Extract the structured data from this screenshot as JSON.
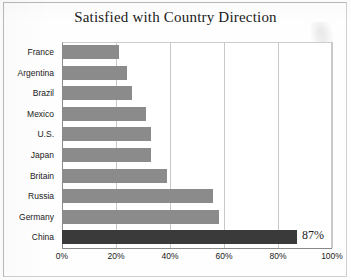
{
  "chart_data": {
    "type": "bar",
    "orientation": "horizontal",
    "title": "Satisfied with Country Direction",
    "xlabel": "",
    "ylabel": "",
    "xlim": [
      0,
      100
    ],
    "grid": true,
    "legend": null,
    "categories": [
      "France",
      "Argentina",
      "Brazil",
      "Mexico",
      "U.S.",
      "Japan",
      "Britain",
      "Russia",
      "Germany",
      "China"
    ],
    "values": [
      21,
      24,
      26,
      31,
      33,
      33,
      39,
      56,
      58,
      87
    ],
    "value_labels": [
      "",
      "",
      "",
      "",
      "",
      "",
      "",
      "",
      "",
      "87%"
    ],
    "xticks": [
      0,
      20,
      40,
      60,
      80,
      100
    ],
    "xtick_labels": [
      "0%",
      "20%",
      "40%",
      "60%",
      "80%",
      "100%"
    ],
    "bar_color": "#8b8b8b",
    "highlight_color": "#3a3a3a",
    "highlight_category": "China"
  },
  "bars": [
    {
      "label": "France",
      "value": 21,
      "value_label": "",
      "highlight": false
    },
    {
      "label": "Argentina",
      "value": 24,
      "value_label": "",
      "highlight": false
    },
    {
      "label": "Brazil",
      "value": 26,
      "value_label": "",
      "highlight": false
    },
    {
      "label": "Mexico",
      "value": 31,
      "value_label": "",
      "highlight": false
    },
    {
      "label": "U.S.",
      "value": 33,
      "value_label": "",
      "highlight": false
    },
    {
      "label": "Japan",
      "value": 33,
      "value_label": "",
      "highlight": false
    },
    {
      "label": "Britain",
      "value": 39,
      "value_label": "",
      "highlight": false
    },
    {
      "label": "Russia",
      "value": 56,
      "value_label": "",
      "highlight": false
    },
    {
      "label": "Germany",
      "value": 58,
      "value_label": "",
      "highlight": false
    },
    {
      "label": "China",
      "value": 87,
      "value_label": "87%",
      "highlight": true
    }
  ]
}
